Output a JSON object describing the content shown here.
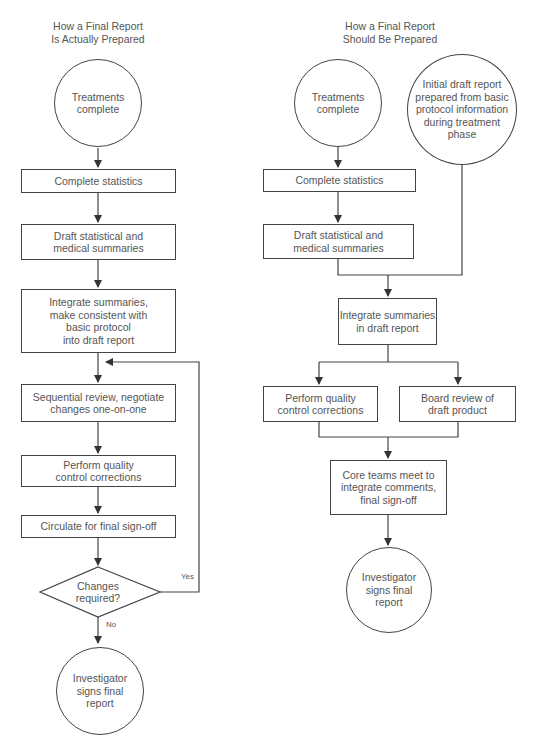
{
  "left": {
    "title": "How a Final Report\nIs Actually Prepared",
    "start": "Treatments\ncomplete",
    "steps": [
      "Complete statistics",
      "Draft statistical and\nmedical summaries",
      "Integrate summaries,\nmake consistent with\nbasic protocol\ninto draft report",
      "Sequential review, negotiate\nchanges one-on-one",
      "Perform quality\ncontrol corrections",
      "Circulate for final sign-off"
    ],
    "decision": "Changes\nrequired?",
    "yes_label": "Yes",
    "no_label": "No",
    "end": "Investigator\nsigns final\nreport"
  },
  "right": {
    "title": "How a Final Report\nShould Be Prepared",
    "start": "Treatments\ncomplete",
    "initial_draft": "Initial draft report\nprepared from basic\nprotocol information\nduring treatment\nphase",
    "steps": [
      "Complete statistics",
      "Draft statistical and\nmedical summaries",
      "Integrate summaries\nin draft report"
    ],
    "parallel": [
      "Perform quality\ncontrol corrections",
      "Board review of\ndraft product"
    ],
    "merge": "Core teams meet to\nintegrate comments,\nfinal sign-off",
    "end": "Investigator\nsigns final\nreport"
  },
  "colors": {
    "line": "#444444",
    "text": "#555555",
    "background": "#ffffff"
  }
}
